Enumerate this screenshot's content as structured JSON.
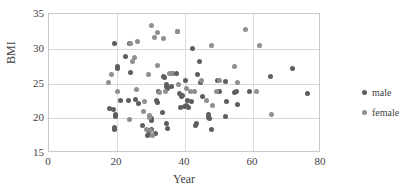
{
  "chart_data": {
    "type": "scatter",
    "title": "",
    "xlabel": "Year",
    "ylabel": "BMI",
    "xlim": [
      0,
      80
    ],
    "ylim": [
      15,
      35
    ],
    "xticks": [
      "0",
      "20",
      "40",
      "60",
      "80"
    ],
    "yticks": [
      "15",
      "20",
      "25",
      "30",
      "35"
    ],
    "grid": "horizontal-and-vertical",
    "legend_position": "right",
    "colors": {
      "male": "#5e5e5e",
      "female": "#8f8f8f",
      "grid": "#d8d8d8",
      "axis": "#c9c9c9",
      "text": "#3f3f3f"
    },
    "series": [
      {
        "name": "male",
        "color": "#5e5e5e",
        "points": [
          [
            19.4,
            30.8
          ],
          [
            23.8,
            30.7
          ],
          [
            24.0,
            26.6
          ],
          [
            22.4,
            28.9
          ],
          [
            20.1,
            27.4
          ],
          [
            20.0,
            27.2
          ],
          [
            21.1,
            22.5
          ],
          [
            23.3,
            22.6
          ],
          [
            25.4,
            22.7
          ],
          [
            19.6,
            20.5
          ],
          [
            19.7,
            20.3
          ],
          [
            19.2,
            18.6
          ],
          [
            19.4,
            18.4
          ],
          [
            26.4,
            22.1
          ],
          [
            27.6,
            19.0
          ],
          [
            29.0,
            17.5
          ],
          [
            29.3,
            17.6
          ],
          [
            29.2,
            18.3
          ],
          [
            30.2,
            18.4
          ],
          [
            31.3,
            17.8
          ],
          [
            31.9,
            22.3
          ],
          [
            31.5,
            22.5
          ],
          [
            32.2,
            23.8
          ],
          [
            33.4,
            20.8
          ],
          [
            34.5,
            19.3
          ],
          [
            34.9,
            18.5
          ],
          [
            33.7,
            26.0
          ],
          [
            34.0,
            25.9
          ],
          [
            34.6,
            24.8
          ],
          [
            34.7,
            24.5
          ],
          [
            34.8,
            24.3
          ],
          [
            36.3,
            26.4
          ],
          [
            37.4,
            26.4
          ],
          [
            38.4,
            23.6
          ],
          [
            39.1,
            23.1
          ],
          [
            39.3,
            23.3
          ],
          [
            38.6,
            21.5
          ],
          [
            39.9,
            21.7
          ],
          [
            40.4,
            21.8
          ],
          [
            40.6,
            22.5
          ],
          [
            41.1,
            21.5
          ],
          [
            42.3,
            30.0
          ],
          [
            43.6,
            26.3
          ],
          [
            44.3,
            28.1
          ],
          [
            44.6,
            25.2
          ],
          [
            45.0,
            23.2
          ],
          [
            43.4,
            19.2
          ],
          [
            43.1,
            18.9
          ],
          [
            46.8,
            20.1
          ],
          [
            47.0,
            20.5
          ],
          [
            47.3,
            19.9
          ],
          [
            47.9,
            18.4
          ],
          [
            49.5,
            25.5
          ],
          [
            50.1,
            23.9
          ],
          [
            52.0,
            25.3
          ],
          [
            52.3,
            22.4
          ],
          [
            51.8,
            20.3
          ],
          [
            54.5,
            23.7
          ],
          [
            55.0,
            23.8
          ],
          [
            55.3,
            22.0
          ],
          [
            58.9,
            23.8
          ],
          [
            65.2,
            26.0
          ],
          [
            71.7,
            27.2
          ],
          [
            76.0,
            23.5
          ],
          [
            17.8,
            21.4
          ],
          [
            19.1,
            21.2
          ],
          [
            30.0,
            20.0
          ],
          [
            30.1,
            19.7
          ],
          [
            36.0,
            24.6
          ],
          [
            37.8,
            32.5
          ],
          [
            40.0,
            25.4
          ],
          [
            41.9,
            22.4
          ]
        ]
      },
      {
        "name": "female",
        "color": "#8f8f8f",
        "points": [
          [
            17.6,
            25.1
          ],
          [
            18.4,
            26.3
          ],
          [
            20.0,
            23.9
          ],
          [
            23.9,
            30.7
          ],
          [
            25.1,
            28.7
          ],
          [
            26.0,
            31.1
          ],
          [
            24.7,
            28.2
          ],
          [
            23.6,
            19.8
          ],
          [
            25.7,
            24.1
          ],
          [
            28.0,
            22.4
          ],
          [
            29.4,
            26.3
          ],
          [
            30.0,
            33.3
          ],
          [
            30.9,
            31.6
          ],
          [
            32.0,
            32.3
          ],
          [
            31.9,
            27.6
          ],
          [
            33.6,
            31.5
          ],
          [
            29.5,
            20.4
          ],
          [
            29.7,
            20.1
          ],
          [
            30.5,
            17.5
          ],
          [
            32.6,
            23.7
          ],
          [
            34.3,
            23.9
          ],
          [
            36.1,
            26.4
          ],
          [
            37.9,
            32.5
          ],
          [
            40.3,
            24.3
          ],
          [
            41.6,
            23.8
          ],
          [
            44.9,
            25.4
          ],
          [
            47.7,
            30.5
          ],
          [
            49.4,
            23.9
          ],
          [
            50.2,
            25.5
          ],
          [
            54.6,
            27.5
          ],
          [
            55.5,
            25.2
          ],
          [
            57.8,
            32.8
          ],
          [
            61.8,
            30.4
          ],
          [
            61.0,
            23.9
          ],
          [
            65.4,
            20.6
          ],
          [
            35.3,
            26.5
          ],
          [
            38.1,
            24.9
          ],
          [
            42.8,
            23.9
          ],
          [
            46.2,
            22.5
          ],
          [
            48.0,
            21.9
          ],
          [
            28.6,
            18.4
          ],
          [
            29.9,
            18.2
          ],
          [
            27.7,
            20.9
          ]
        ]
      }
    ]
  }
}
